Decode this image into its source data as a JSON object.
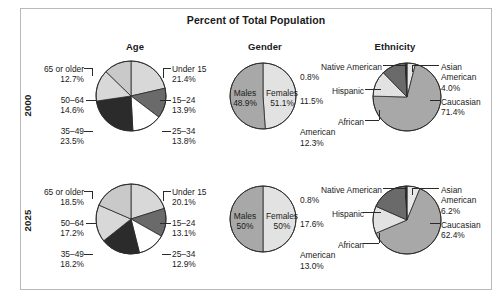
{
  "figure": {
    "title": "Percent of Total Population",
    "column_headers": [
      "Age",
      "Gender",
      "Ethnicity"
    ],
    "row_labels": [
      "2000",
      "2025"
    ]
  },
  "colors": {
    "background": "#ffffff",
    "frame_border": "#b9b9b9",
    "text": "#1a1a1a",
    "slice_outline": "#2a2a2a",
    "white": "#ffffff",
    "light": "#d8d8d8",
    "light2": "#c9c9c9",
    "medium": "#a8a8a8",
    "dark": "#6a6a6a",
    "darker": "#4a4a4a",
    "black": "#2b2b2b"
  },
  "chart_data": [
    {
      "type": "pie",
      "title": "Age",
      "row": "2000",
      "categories": [
        "Under 15",
        "15–24",
        "25–34",
        "35–49",
        "50–64",
        "65 or older"
      ],
      "values": [
        21.4,
        13.9,
        13.8,
        23.5,
        14.6,
        12.7
      ],
      "labels": [
        "21.4%",
        "13.9%",
        "13.8%",
        "23.5%",
        "14.6%",
        "12.7%"
      ],
      "slice_colors": [
        "#d8d8d8",
        "#6a6a6a",
        "#ffffff",
        "#2b2b2b",
        "#d8d8d8",
        "#c9c9c9"
      ],
      "units": "percent"
    },
    {
      "type": "pie",
      "title": "Gender",
      "row": "2000",
      "categories": [
        "Males",
        "Females"
      ],
      "values": [
        48.9,
        51.1
      ],
      "labels": [
        "48.9%",
        "51.1%"
      ],
      "slice_colors": [
        "#e2e2e2",
        "#a8a8a8"
      ],
      "units": "percent"
    },
    {
      "type": "pie",
      "title": "Ethnicity",
      "row": "2000",
      "categories": [
        "Asian American",
        "Caucasian",
        "African American",
        "Hispanic",
        "Native American"
      ],
      "values": [
        4.0,
        71.4,
        12.3,
        11.5,
        0.8
      ],
      "labels": [
        "4.0%",
        "71.4%",
        "12.3%",
        "11.5%",
        "0.8%"
      ],
      "slice_colors": [
        "#e8e8e8",
        "#a8a8a8",
        "#e2e2e2",
        "#6a6a6a",
        "#2b2b2b"
      ],
      "units": "percent"
    },
    {
      "type": "pie",
      "title": "Age",
      "row": "2025",
      "categories": [
        "Under 15",
        "15–24",
        "25–34",
        "35–49",
        "50–64",
        "65 or older"
      ],
      "values": [
        20.1,
        13.1,
        12.9,
        18.2,
        17.2,
        18.5
      ],
      "labels": [
        "20.1%",
        "13.1%",
        "12.9%",
        "18.2%",
        "17.2%",
        "18.5%"
      ],
      "slice_colors": [
        "#d8d8d8",
        "#6a6a6a",
        "#ffffff",
        "#2b2b2b",
        "#d8d8d8",
        "#c9c9c9"
      ],
      "units": "percent"
    },
    {
      "type": "pie",
      "title": "Gender",
      "row": "2025",
      "categories": [
        "Males",
        "Females"
      ],
      "values": [
        50,
        50
      ],
      "labels": [
        "50%",
        "50%"
      ],
      "slice_colors": [
        "#e2e2e2",
        "#a8a8a8"
      ],
      "units": "percent"
    },
    {
      "type": "pie",
      "title": "Ethnicity",
      "row": "2025",
      "categories": [
        "Asian American",
        "Caucasian",
        "African American",
        "Hispanic",
        "Native American"
      ],
      "values": [
        6.2,
        62.4,
        13.0,
        17.6,
        0.8
      ],
      "labels": [
        "6.2%",
        "62.4%",
        "13.0%",
        "17.6%",
        "0.8%"
      ],
      "slice_colors": [
        "#e8e8e8",
        "#a8a8a8",
        "#e2e2e2",
        "#6a6a6a",
        "#2b2b2b"
      ],
      "units": "percent"
    }
  ],
  "annotations": {
    "age2000": {
      "under15_name": "Under 15",
      "under15_val": "21.4%",
      "a1524_name": "15–24",
      "a1524_val": "13.9%",
      "a2534_name": "25–34",
      "a2534_val": "13.8%",
      "a3549_name": "35–49",
      "a3549_val": "23.5%",
      "a5064_name": "50–64",
      "a5064_val": "14.6%",
      "a65_name": "65 or older",
      "a65_val": "12.7%"
    },
    "age2025": {
      "under15_name": "Under 15",
      "under15_val": "20.1%",
      "a1524_name": "15–24",
      "a1524_val": "13.1%",
      "a2534_name": "25–34",
      "a2534_val": "12.9%",
      "a3549_name": "35–49",
      "a3549_val": "18.2%",
      "a5064_name": "50–64",
      "a5064_val": "17.2%",
      "a65_name": "65 or older",
      "a65_val": "18.5%"
    },
    "gender2000": {
      "males_name": "Males",
      "males_val": "48.9%",
      "females_name": "Females",
      "females_val": "51.1%"
    },
    "gender2025": {
      "males_name": "Males",
      "males_val": "50%",
      "females_name": "Females",
      "females_val": "50%"
    },
    "eth2000": {
      "native_name": "Native American",
      "native_val": "0.8%",
      "hispanic_name": "Hispanic",
      "hispanic_val": "11.5%",
      "african_name1": "African",
      "african_name2": "American",
      "african_val": "12.3%",
      "asian_name1": "Asian",
      "asian_name2": "American",
      "asian_val": "4.0%",
      "cauc_name": "Caucasian",
      "cauc_val": "71.4%"
    },
    "eth2025": {
      "native_name": "Native American",
      "native_val": "0.8%",
      "hispanic_name": "Hispanic",
      "hispanic_val": "17.6%",
      "african_name1": "African",
      "african_name2": "American",
      "african_val": "13.0%",
      "asian_name1": "Asian",
      "asian_name2": "American",
      "asian_val": "6.2%",
      "cauc_name": "Caucasian",
      "cauc_val": "62.4%"
    }
  }
}
